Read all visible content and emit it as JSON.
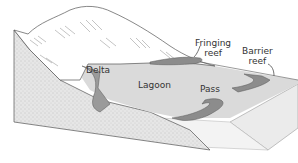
{
  "figure": {
    "type": "block-diagram",
    "labels": {
      "delta": "Delta",
      "lagoon": "Lagoon",
      "pass": "Pass",
      "fringing_reef_line1": "Fringing",
      "fringing_reef_line2": "reef",
      "barrier_reef_line1": "Barrier",
      "barrier_reef_line2": "reef"
    },
    "colors": {
      "lagoon_water": "#dcdcdc",
      "reef": "#8c8c8c",
      "sediment_side": "#e4e4e4",
      "ocean_block": "#eeeeee",
      "outline": "#444444",
      "land": "#ffffff"
    }
  }
}
